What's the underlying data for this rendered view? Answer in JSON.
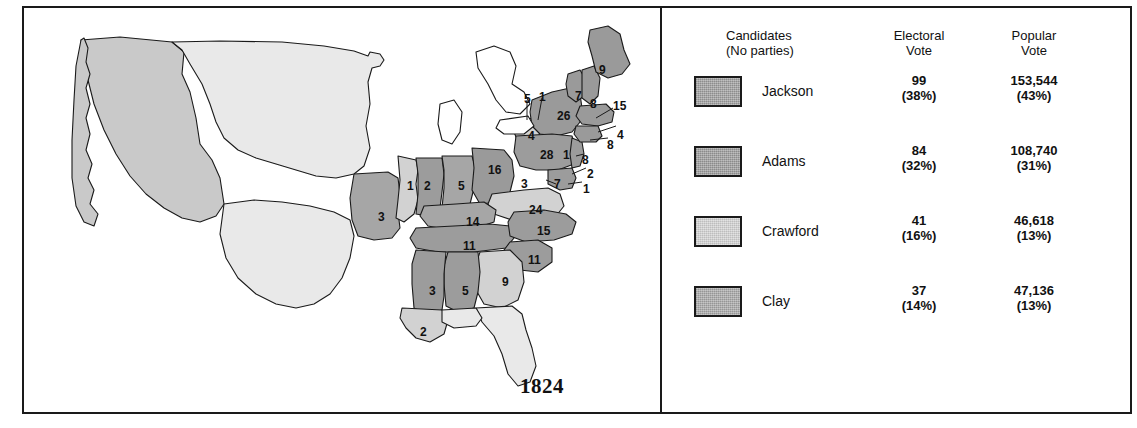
{
  "map": {
    "year": "1824",
    "title": "1824 United States presidential election electoral map",
    "colors": {
      "jackson": "#9c9c9c",
      "adams": "#9a9a9a",
      "crawford": "#d2d2d2",
      "clay": "#a6a6a6",
      "territory_light": "#e9e9e9",
      "territory_med": "#c9c9c9",
      "outline": "#1a1a1a",
      "background": "#ffffff"
    },
    "state_labels": [
      {
        "name": "maine",
        "value": "9",
        "x": 575,
        "y": 56
      },
      {
        "name": "vermont",
        "value": "7",
        "x": 551,
        "y": 82
      },
      {
        "name": "new-hampshire",
        "value": "8",
        "x": 566,
        "y": 90
      },
      {
        "name": "massachusetts",
        "value": "15",
        "x": 589,
        "y": 92
      },
      {
        "name": "new-york",
        "value": "26",
        "x": 533,
        "y": 102
      },
      {
        "name": "rhode-island",
        "value": "4",
        "x": 593,
        "y": 121
      },
      {
        "name": "connecticut",
        "value": "8",
        "x": 583,
        "y": 131
      },
      {
        "name": "michigan-territory",
        "value": "5",
        "x": 500,
        "y": 85
      },
      {
        "name": "upper-lakes",
        "value": "1",
        "x": 515,
        "y": 83
      },
      {
        "name": "lower-michigan",
        "value": "4",
        "x": 504,
        "y": 122
      },
      {
        "name": "pennsylvania",
        "value": "28",
        "x": 516,
        "y": 141
      },
      {
        "name": "new-jersey-state",
        "value": "1",
        "x": 539,
        "y": 141
      },
      {
        "name": "new-jersey",
        "value": "8",
        "x": 558,
        "y": 146
      },
      {
        "name": "delaware",
        "value": "2",
        "x": 563,
        "y": 160
      },
      {
        "name": "maryland",
        "value": "1",
        "x": 559,
        "y": 175
      },
      {
        "name": "maryland-west",
        "value": "7",
        "x": 530,
        "y": 170
      },
      {
        "name": "ohio",
        "value": "16",
        "x": 464,
        "y": 156
      },
      {
        "name": "virginia-west",
        "value": "3",
        "x": 497,
        "y": 170
      },
      {
        "name": "indiana",
        "value": "5",
        "x": 434,
        "y": 172
      },
      {
        "name": "illinois",
        "value": "2",
        "x": 400,
        "y": 172
      },
      {
        "name": "missouri-east",
        "value": "1",
        "x": 383,
        "y": 172
      },
      {
        "name": "missouri",
        "value": "3",
        "x": 354,
        "y": 203
      },
      {
        "name": "virginia",
        "value": "24",
        "x": 505,
        "y": 196
      },
      {
        "name": "kentucky",
        "value": "14",
        "x": 442,
        "y": 208
      },
      {
        "name": "north-carolina",
        "value": "15",
        "x": 513,
        "y": 217
      },
      {
        "name": "tennessee",
        "value": "11",
        "x": 439,
        "y": 232
      },
      {
        "name": "south-carolina",
        "value": "11",
        "x": 504,
        "y": 246
      },
      {
        "name": "georgia",
        "value": "9",
        "x": 478,
        "y": 268
      },
      {
        "name": "alabama",
        "value": "5",
        "x": 438,
        "y": 277
      },
      {
        "name": "mississippi",
        "value": "3",
        "x": 405,
        "y": 277
      },
      {
        "name": "louisiana",
        "value": "2",
        "x": 396,
        "y": 318
      }
    ]
  },
  "legend": {
    "headers": {
      "candidates_line1": "Candidates",
      "candidates_line2": "(No parties)",
      "electoral_line1": "Electoral",
      "electoral_line2": "Vote",
      "popular_line1": "Popular",
      "popular_line2": "Vote"
    },
    "rows": [
      {
        "name": "Jackson",
        "electoral": "99",
        "electoral_pct": "(38%)",
        "popular": "153,544",
        "popular_pct": "(43%)",
        "swatch": "#9c9c9c"
      },
      {
        "name": "Adams",
        "electoral": "84",
        "electoral_pct": "(32%)",
        "popular": "108,740",
        "popular_pct": "(31%)",
        "swatch": "#9a9a9a"
      },
      {
        "name": "Crawford",
        "electoral": "41",
        "electoral_pct": "(16%)",
        "popular": "46,618",
        "popular_pct": "(13%)",
        "swatch": "#d2d2d2"
      },
      {
        "name": "Clay",
        "electoral": "37",
        "electoral_pct": "(14%)",
        "popular": "47,136",
        "popular_pct": "(13%)",
        "swatch": "#a6a6a6"
      }
    ]
  },
  "chart_data": {
    "type": "map",
    "categories": [
      "Jackson",
      "Adams",
      "Crawford",
      "Clay"
    ],
    "series": [
      {
        "name": "Electoral Vote",
        "values": [
          99,
          84,
          41,
          37
        ]
      },
      {
        "name": "Electoral Vote %",
        "values": [
          38,
          32,
          16,
          14
        ]
      },
      {
        "name": "Popular Vote",
        "values": [
          153544,
          108740,
          46618,
          47136
        ]
      },
      {
        "name": "Popular Vote %",
        "values": [
          43,
          31,
          13,
          13
        ]
      }
    ]
  }
}
